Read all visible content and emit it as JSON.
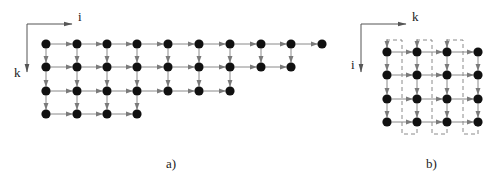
{
  "colors": {
    "node": "#111111",
    "edge": "#8a8a8a",
    "arrowhead": "#7a7a7a",
    "axis": "#555555",
    "dashed": "#7d7d7d",
    "text": "#222222"
  },
  "panels": [
    {
      "id": "a",
      "caption": "a)",
      "caption_pos": {
        "x": 166,
        "y": 157
      },
      "axis": {
        "origin": [
          27,
          24
        ],
        "h_end": [
          72,
          24
        ],
        "v_end": [
          27,
          72
        ],
        "h_label": "i",
        "h_label_pos": {
          "x": 78,
          "y": 10
        },
        "v_label": "k",
        "v_label_pos": {
          "x": 14,
          "y": 66
        }
      },
      "columns_x": [
        46,
        77,
        107,
        137,
        168,
        199,
        230,
        261,
        291,
        322
      ],
      "rows_y": [
        44,
        67,
        91,
        114
      ],
      "row_lengths": [
        10,
        9,
        7,
        4
      ],
      "incoming_top_stubs": [],
      "dashed_groups": []
    },
    {
      "id": "b",
      "caption": "b)",
      "caption_pos": {
        "x": 426,
        "y": 157
      },
      "axis": {
        "origin": [
          361,
          24
        ],
        "h_end": [
          406,
          24
        ],
        "v_end": [
          361,
          72
        ],
        "h_label": "k",
        "h_label_pos": {
          "x": 412,
          "y": 10
        },
        "v_label": "i",
        "v_label_pos": {
          "x": 351,
          "y": 58
        }
      },
      "columns_x": [
        387,
        417,
        447,
        478
      ],
      "rows_y": [
        52,
        75,
        99,
        122
      ],
      "row_lengths": [
        4,
        4,
        4,
        4
      ],
      "incoming_top_stubs": [
        0,
        1,
        2
      ],
      "dashed_groups": [
        {
          "top_left_x": 387,
          "mid_x": 402,
          "bottom_right_x": 417,
          "top_y": 40,
          "bottom_y": 134
        },
        {
          "top_left_x": 417,
          "mid_x": 432,
          "bottom_right_x": 447,
          "top_y": 40,
          "bottom_y": 134
        },
        {
          "top_left_x": 447,
          "mid_x": 463,
          "bottom_right_x": 478,
          "top_y": 40,
          "bottom_y": 134
        }
      ]
    }
  ]
}
